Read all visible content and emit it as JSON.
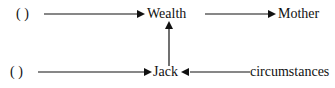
{
  "diagram": {
    "nodes": {
      "blank_top": "(    )",
      "blank_bottom": "(    )",
      "wealth": "Wealth",
      "mother": "Mother",
      "jack": "Jack",
      "circumstances": "circumstances"
    },
    "edges": [
      {
        "from": "blank_top",
        "to": "wealth"
      },
      {
        "from": "wealth",
        "to": "mother"
      },
      {
        "from": "jack",
        "to": "wealth"
      },
      {
        "from": "blank_bottom",
        "to": "jack"
      },
      {
        "from": "circumstances",
        "to": "jack"
      }
    ]
  }
}
